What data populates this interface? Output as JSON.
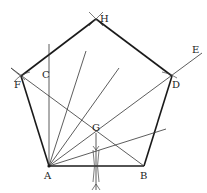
{
  "diagram": {
    "type": "geometric-construction",
    "colors": {
      "stroke": "#1a1a1a",
      "thin": "#333333",
      "background": "#ffffff"
    },
    "points": {
      "A": {
        "label": "A"
      },
      "B": {
        "label": "B"
      },
      "C": {
        "label": "C"
      },
      "D": {
        "label": "D"
      },
      "E": {
        "label": "E"
      },
      "F": {
        "label": "F"
      },
      "G": {
        "label": "G"
      },
      "H": {
        "label": "H"
      }
    },
    "pentagon": [
      "A",
      "B",
      "D",
      "H",
      "F"
    ],
    "construction_lines": [
      "AC perpendicular",
      "AE ray through D",
      "FB diagonal",
      "perpendicular bisector of AB through G",
      "angle-trisecting rays from A"
    ]
  }
}
